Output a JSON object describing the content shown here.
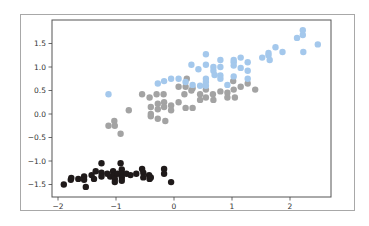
{
  "chart_data": {
    "type": "scatter",
    "title": "",
    "xlabel": "",
    "ylabel": "",
    "xlim": [
      -2.1,
      2.7
    ],
    "ylim": [
      -1.77,
      1.98
    ],
    "xticks": [
      -2,
      -1,
      0,
      1,
      2
    ],
    "xtick_labels": [
      "−2",
      "−1",
      "0",
      "1",
      "2"
    ],
    "yticks": [
      1.5,
      1.0,
      0.5,
      0.0,
      -0.5,
      -1.0,
      -1.5
    ],
    "ytick_labels": [
      "1.5",
      "1.0",
      "0.5",
      "0.0",
      "−0.5",
      "−1.0",
      "−1.5"
    ],
    "grid": false,
    "legend": null,
    "series": [
      {
        "name": "cluster-0",
        "color": "#1f1a1a",
        "points": [
          [
            -1.9,
            -1.5
          ],
          [
            -1.78,
            -1.4
          ],
          [
            -1.77,
            -1.36
          ],
          [
            -1.65,
            -1.38
          ],
          [
            -1.55,
            -1.33
          ],
          [
            -1.55,
            -1.4
          ],
          [
            -1.52,
            -1.55
          ],
          [
            -1.42,
            -1.3
          ],
          [
            -1.38,
            -1.38
          ],
          [
            -1.35,
            -1.22
          ],
          [
            -1.25,
            -1.05
          ],
          [
            -1.25,
            -1.25
          ],
          [
            -1.25,
            -1.33
          ],
          [
            -1.15,
            -1.27
          ],
          [
            -1.1,
            -1.33
          ],
          [
            -1.05,
            -1.22
          ],
          [
            -1.03,
            -1.3
          ],
          [
            -1.02,
            -1.38
          ],
          [
            -1.02,
            -1.45
          ],
          [
            -0.97,
            -1.27
          ],
          [
            -0.92,
            -1.05
          ],
          [
            -0.9,
            -1.18
          ],
          [
            -0.9,
            -1.27
          ],
          [
            -0.9,
            -1.35
          ],
          [
            -0.9,
            -1.42
          ],
          [
            -0.82,
            -1.27
          ],
          [
            -0.75,
            -1.3
          ],
          [
            -0.65,
            -1.27
          ],
          [
            -0.55,
            -1.17
          ],
          [
            -0.53,
            -1.25
          ],
          [
            -0.53,
            -1.35
          ],
          [
            -0.43,
            -1.3
          ],
          [
            -0.42,
            -1.38
          ],
          [
            -0.4,
            -1.35
          ],
          [
            -0.17,
            -1.17
          ],
          [
            -0.17,
            -1.27
          ],
          [
            -0.05,
            -1.45
          ]
        ]
      },
      {
        "name": "cluster-1",
        "color": "#a3a3a3",
        "points": [
          [
            -1.13,
            -0.25
          ],
          [
            -1.03,
            -0.15
          ],
          [
            -1.02,
            -0.25
          ],
          [
            -0.92,
            -0.42
          ],
          [
            -0.78,
            0.08
          ],
          [
            -0.55,
            0.42
          ],
          [
            -0.42,
            0.35
          ],
          [
            -0.4,
            0.15
          ],
          [
            -0.4,
            0.0
          ],
          [
            -0.4,
            -0.05
          ],
          [
            -0.3,
            0.42
          ],
          [
            -0.28,
            0.22
          ],
          [
            -0.28,
            0.1
          ],
          [
            -0.28,
            -0.1
          ],
          [
            -0.18,
            0.42
          ],
          [
            -0.17,
            0.25
          ],
          [
            -0.17,
            0.15
          ],
          [
            -0.15,
            -0.15
          ],
          [
            -0.05,
            0.18
          ],
          [
            -0.05,
            0.08
          ],
          [
            0.08,
            0.25
          ],
          [
            0.08,
            0.58
          ],
          [
            0.18,
            0.42
          ],
          [
            0.2,
            0.13
          ],
          [
            0.2,
            0.58
          ],
          [
            0.22,
            0.75
          ],
          [
            0.3,
            0.5
          ],
          [
            0.32,
            0.55
          ],
          [
            0.32,
            0.13
          ],
          [
            0.45,
            0.42
          ],
          [
            0.45,
            0.3
          ],
          [
            0.55,
            0.52
          ],
          [
            0.55,
            0.35
          ],
          [
            0.67,
            0.42
          ],
          [
            0.68,
            0.3
          ],
          [
            0.8,
            0.48
          ],
          [
            0.92,
            0.45
          ],
          [
            0.92,
            0.35
          ],
          [
            1.02,
            0.7
          ],
          [
            1.03,
            0.52
          ],
          [
            1.05,
            0.35
          ],
          [
            1.15,
            0.58
          ],
          [
            1.27,
            0.65
          ],
          [
            1.4,
            0.52
          ]
        ]
      },
      {
        "name": "cluster-2",
        "color": "#a4c8ec",
        "points": [
          [
            -1.13,
            0.42
          ],
          [
            -0.28,
            0.65
          ],
          [
            -0.17,
            0.7
          ],
          [
            -0.05,
            0.75
          ],
          [
            0.08,
            0.75
          ],
          [
            0.2,
            0.68
          ],
          [
            0.3,
            1.05
          ],
          [
            0.32,
            0.62
          ],
          [
            0.42,
            0.95
          ],
          [
            0.45,
            0.6
          ],
          [
            0.55,
            1.27
          ],
          [
            0.55,
            1.05
          ],
          [
            0.55,
            0.75
          ],
          [
            0.55,
            0.68
          ],
          [
            0.55,
            0.6
          ],
          [
            0.68,
            1.0
          ],
          [
            0.68,
            0.92
          ],
          [
            0.7,
            0.83
          ],
          [
            0.8,
            1.15
          ],
          [
            0.8,
            1.0
          ],
          [
            0.8,
            0.82
          ],
          [
            0.8,
            0.75
          ],
          [
            0.92,
            0.62
          ],
          [
            1.03,
            1.15
          ],
          [
            1.03,
            1.1
          ],
          [
            1.03,
            1.03
          ],
          [
            1.03,
            0.8
          ],
          [
            1.15,
            1.2
          ],
          [
            1.15,
            0.98
          ],
          [
            1.27,
            1.1
          ],
          [
            1.27,
            0.92
          ],
          [
            1.27,
            0.75
          ],
          [
            1.52,
            1.2
          ],
          [
            1.63,
            1.3
          ],
          [
            1.63,
            1.25
          ],
          [
            1.65,
            1.15
          ],
          [
            1.75,
            1.42
          ],
          [
            1.87,
            1.32
          ],
          [
            2.12,
            1.62
          ],
          [
            2.22,
            1.78
          ],
          [
            2.22,
            1.68
          ],
          [
            2.23,
            1.32
          ],
          [
            2.48,
            1.48
          ]
        ]
      }
    ]
  },
  "layout": {
    "frame_color": "#555555",
    "tick_color": "#444444",
    "label_color": "#333333",
    "figure_border": "#a8a8a8",
    "axes_px": {
      "left": 52,
      "top": 20,
      "right": 331,
      "bottom": 197
    },
    "x_map": {
      "origin_px": 174,
      "px_per_unit": 58
    },
    "y_map": {
      "origin_px": 114,
      "px_per_unit": 47
    },
    "marker_radius": 3.2
  }
}
